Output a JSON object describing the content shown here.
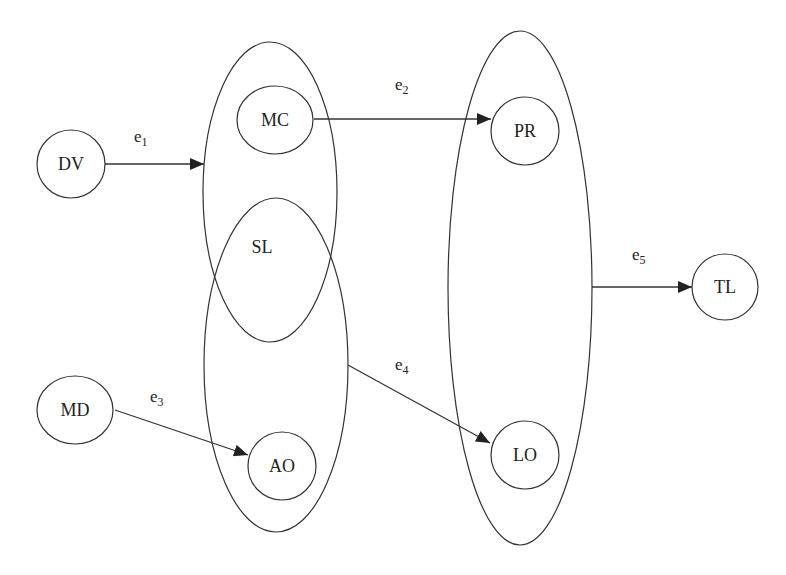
{
  "diagram": {
    "type": "node-edge graph with grouping ellipses",
    "nodes": [
      {
        "id": "DV",
        "label": "DV"
      },
      {
        "id": "MC",
        "label": "MC"
      },
      {
        "id": "MD",
        "label": "MD"
      },
      {
        "id": "AO",
        "label": "AO"
      },
      {
        "id": "PR",
        "label": "PR"
      },
      {
        "id": "LO",
        "label": "LO"
      },
      {
        "id": "TL",
        "label": "TL"
      }
    ],
    "groups": [
      {
        "id": "upper-group",
        "label": "SL",
        "contains": [
          "MC"
        ]
      },
      {
        "id": "lower-group",
        "label": "",
        "contains": [
          "AO"
        ]
      },
      {
        "id": "right-group",
        "label": "",
        "contains": [
          "PR",
          "LO"
        ]
      }
    ],
    "edges": [
      {
        "id": "e1",
        "base": "e",
        "sub": "1",
        "from": "DV",
        "to": "upper-group"
      },
      {
        "id": "e2",
        "base": "e",
        "sub": "2",
        "from": "MC",
        "to": "PR"
      },
      {
        "id": "e3",
        "base": "e",
        "sub": "3",
        "from": "MD",
        "to": "AO"
      },
      {
        "id": "e4",
        "base": "e",
        "sub": "4",
        "from": "lower-group",
        "to": "LO"
      },
      {
        "id": "e5",
        "base": "e",
        "sub": "5",
        "from": "right-group",
        "to": "TL"
      }
    ]
  },
  "colors": {
    "stroke": "#333333",
    "text": "#222222",
    "background": "#ffffff"
  }
}
